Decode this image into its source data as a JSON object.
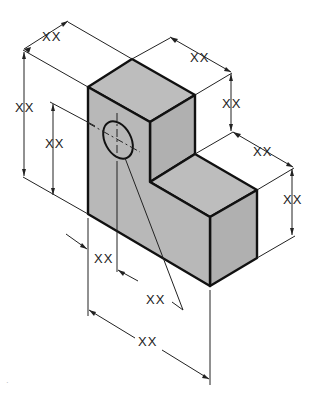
{
  "drawing": {
    "type": "isometric-dimensioned-part",
    "colors": {
      "face_fill": "#b3b3b3",
      "face_top": "#bdbdbd",
      "line": "#111111",
      "background": "#ffffff"
    },
    "labels": {
      "top_depth": "XX",
      "overall_height": "XX",
      "hole_height": "XX",
      "upper_width": "XX",
      "step_height": "XX",
      "lower_width": "XX",
      "lower_height": "XX",
      "hole_offset": "XX",
      "hole_diameter": "XX",
      "overall_length": "XX"
    },
    "marks": {
      "stray": "·"
    }
  }
}
